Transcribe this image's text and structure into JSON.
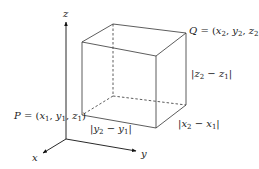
{
  "diagram": {
    "type": "3d-coordinate-box",
    "axes": {
      "x": "x",
      "y": "y",
      "z": "z"
    },
    "points": {
      "P": {
        "name": "P",
        "coords": "(x1, y1, z1)",
        "label_prefix": "P = (x",
        "label_full": "P = (x₁, y₁, z₁)"
      },
      "Q": {
        "name": "Q",
        "coords": "(x2, y2, z2)",
        "label_full": "Q = (x₂, y₂, z₂)"
      }
    },
    "dimensions": {
      "height": "|z₂ − z₁|",
      "depth": "|y₂ − y₁|",
      "width": "|x₂ − x₁|"
    }
  }
}
